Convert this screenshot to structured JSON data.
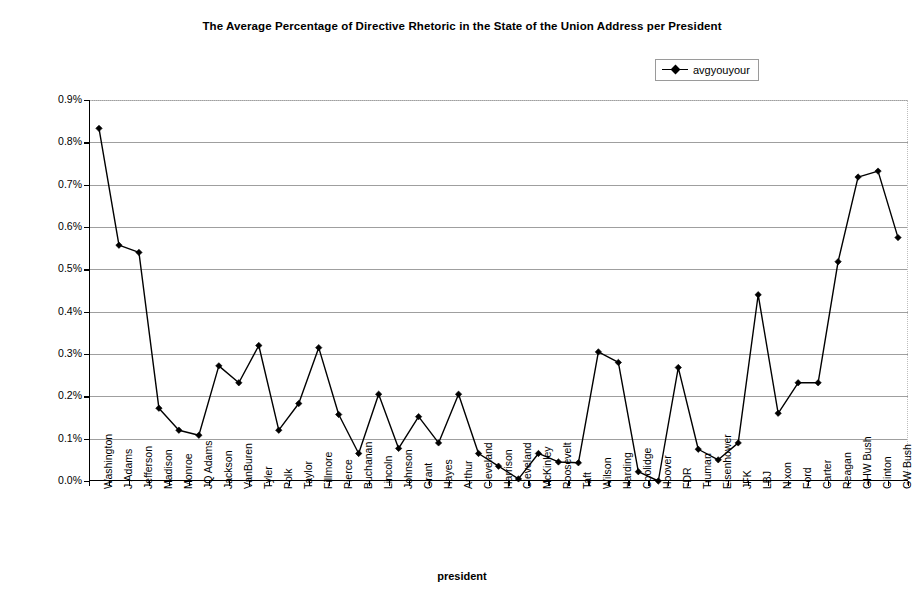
{
  "chart_data": {
    "type": "line",
    "title": "The Average Percentage of Directive Rhetoric in the State of the Union Address per President",
    "xlabel": "president",
    "ylabel": "percentage",
    "ylim": [
      0.0,
      0.9
    ],
    "ytick_values": [
      0.0,
      0.1,
      0.2,
      0.3,
      0.4,
      0.5,
      0.6,
      0.7,
      0.8,
      0.9
    ],
    "ytick_labels": [
      "0.0%",
      "0.1%",
      "0.2%",
      "0.3%",
      "0.4%",
      "0.5%",
      "0.6%",
      "0.7%",
      "0.8%",
      "0.9%"
    ],
    "grid": true,
    "legend_position": "top-right",
    "series": [
      {
        "name": "avgyouyour",
        "marker": "diamond",
        "color": "#000000",
        "values": [
          0.833,
          0.557,
          0.54,
          0.172,
          0.12,
          0.108,
          0.272,
          0.232,
          0.32,
          0.12,
          0.183,
          0.315,
          0.157,
          0.065,
          0.205,
          0.077,
          0.152,
          0.09,
          0.205,
          0.065,
          0.035,
          0.005,
          0.065,
          0.045,
          0.043,
          0.305,
          0.28,
          0.022,
          0.0,
          0.268,
          0.075,
          0.05,
          0.09,
          0.44,
          0.16,
          0.232,
          0.232,
          0.518,
          0.718,
          0.732,
          0.575
        ]
      }
    ],
    "categories": [
      "Washington",
      "J Adams",
      "Jefferson",
      "Madison",
      "Monroe",
      "JQ Adams",
      "Jackson",
      "VanBuren",
      "Tyler",
      "Polk",
      "Taylor",
      "Fillmore",
      "Pierce",
      "Buchanan",
      "Lincoln",
      "Johnson",
      "Grant",
      "Hayes",
      "Arthur",
      "Cleveland",
      "Harrison",
      "Cleveland",
      "McKinley",
      "Roosevelt",
      "Taft",
      "Wilson",
      "Harding",
      "Coolidge",
      "Hoover",
      "FDR",
      "Truman",
      "Eisenhower",
      "JFK",
      "LBJ",
      "Nixon",
      "Ford",
      "Carter",
      "Reagan",
      "GHW Bush",
      "Clinton",
      "GW Bush"
    ]
  },
  "legend": {
    "entries": [
      {
        "label": "avgyouyour",
        "marker": "diamond-line-marker"
      }
    ]
  },
  "colors": {
    "series": "#000000",
    "gridline": "#9f9f9f",
    "axis": "#000000",
    "background": "#ffffff"
  }
}
